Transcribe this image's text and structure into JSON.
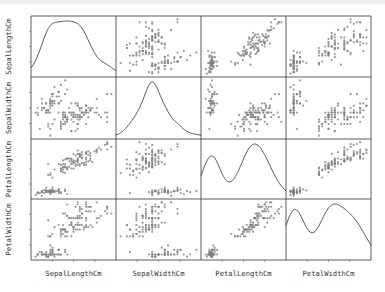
{
  "chart_data": {
    "type": "scatter_matrix",
    "title": "",
    "variables": [
      "SepalLengthCm",
      "SepalWidthCm",
      "PetalLengthCm",
      "PetalWidthCm"
    ],
    "diagonal": "kde",
    "grid": false,
    "legend": null,
    "ranges": {
      "SepalLengthCm": [
        4.3,
        7.9
      ],
      "SepalWidthCm": [
        2.0,
        4.4
      ],
      "PetalLengthCm": [
        1.0,
        6.9
      ],
      "PetalWidthCm": [
        0.1,
        2.5
      ]
    },
    "marker_color": "#808080",
    "line_color": "#444444",
    "frame_color": "#333333",
    "n_points": 150,
    "data": {
      "SepalLengthCm": [
        5.1,
        4.9,
        4.7,
        4.6,
        5.0,
        5.4,
        4.6,
        5.0,
        4.4,
        4.9,
        5.4,
        4.8,
        4.8,
        4.3,
        5.8,
        5.7,
        5.4,
        5.1,
        5.7,
        5.1,
        5.4,
        5.1,
        4.6,
        5.1,
        4.8,
        5.0,
        5.0,
        5.2,
        5.2,
        4.7,
        4.8,
        5.4,
        5.2,
        5.5,
        4.9,
        5.0,
        5.5,
        4.9,
        4.4,
        5.1,
        5.0,
        4.5,
        4.4,
        5.0,
        5.1,
        4.8,
        5.1,
        4.6,
        5.3,
        5.0,
        7.0,
        6.4,
        6.9,
        5.5,
        6.5,
        5.7,
        6.3,
        4.9,
        6.6,
        5.2,
        5.0,
        5.9,
        6.0,
        6.1,
        5.6,
        6.7,
        5.6,
        5.8,
        6.2,
        5.6,
        5.9,
        6.1,
        6.3,
        6.1,
        6.4,
        6.6,
        6.8,
        6.7,
        6.0,
        5.7,
        5.5,
        5.5,
        5.8,
        6.0,
        5.4,
        6.0,
        6.7,
        6.3,
        5.6,
        5.5,
        5.5,
        6.1,
        5.8,
        5.0,
        5.6,
        5.7,
        5.7,
        6.2,
        5.1,
        5.7,
        6.3,
        5.8,
        7.1,
        6.3,
        6.5,
        7.6,
        4.9,
        7.3,
        6.7,
        7.2,
        6.5,
        6.4,
        6.8,
        5.7,
        5.8,
        6.4,
        6.5,
        7.7,
        7.7,
        6.0,
        6.9,
        5.6,
        7.7,
        6.3,
        6.7,
        7.2,
        6.2,
        6.1,
        6.4,
        7.2,
        7.4,
        7.9,
        6.4,
        6.3,
        6.1,
        7.7,
        6.3,
        6.4,
        6.0,
        6.9,
        6.7,
        6.9,
        5.8,
        6.8,
        6.7,
        6.7,
        6.3,
        6.5,
        6.2,
        5.9
      ],
      "SepalWidthCm": [
        3.5,
        3.0,
        3.2,
        3.1,
        3.6,
        3.9,
        3.4,
        3.4,
        2.9,
        3.1,
        3.7,
        3.4,
        3.0,
        3.0,
        4.0,
        4.4,
        3.9,
        3.5,
        3.8,
        3.8,
        3.4,
        3.7,
        3.6,
        3.3,
        3.4,
        3.0,
        3.4,
        3.5,
        3.4,
        3.2,
        3.1,
        3.4,
        4.1,
        4.2,
        3.1,
        3.2,
        3.5,
        3.1,
        3.0,
        3.4,
        3.5,
        2.3,
        3.2,
        3.5,
        3.8,
        3.0,
        3.8,
        3.2,
        3.7,
        3.3,
        3.2,
        3.2,
        3.1,
        2.3,
        2.8,
        2.8,
        3.3,
        2.4,
        2.9,
        2.7,
        2.0,
        3.0,
        2.2,
        2.9,
        2.9,
        3.1,
        3.0,
        2.7,
        2.2,
        2.5,
        3.2,
        2.8,
        2.5,
        2.8,
        2.9,
        3.0,
        2.8,
        3.0,
        2.9,
        2.6,
        2.4,
        2.4,
        2.7,
        2.7,
        3.0,
        3.4,
        3.1,
        2.3,
        3.0,
        2.5,
        2.6,
        3.0,
        2.6,
        2.3,
        2.7,
        3.0,
        2.9,
        2.9,
        2.5,
        2.8,
        3.3,
        2.7,
        3.0,
        2.9,
        3.0,
        3.0,
        2.5,
        2.9,
        2.5,
        3.6,
        3.2,
        2.7,
        3.0,
        2.5,
        2.8,
        3.2,
        3.0,
        3.8,
        2.6,
        2.2,
        3.2,
        2.8,
        2.8,
        2.7,
        3.3,
        3.2,
        2.8,
        3.0,
        2.8,
        3.0,
        2.8,
        3.8,
        2.8,
        2.8,
        2.6,
        3.0,
        3.4,
        3.1,
        3.0,
        3.1,
        3.1,
        3.1,
        2.7,
        3.2,
        3.3,
        3.0,
        2.5,
        3.0,
        3.4,
        3.0
      ],
      "PetalLengthCm": [
        1.4,
        1.4,
        1.3,
        1.5,
        1.4,
        1.7,
        1.4,
        1.5,
        1.4,
        1.5,
        1.5,
        1.6,
        1.4,
        1.1,
        1.2,
        1.5,
        1.3,
        1.4,
        1.7,
        1.5,
        1.7,
        1.5,
        1.0,
        1.7,
        1.9,
        1.6,
        1.6,
        1.5,
        1.4,
        1.6,
        1.6,
        1.5,
        1.5,
        1.4,
        1.5,
        1.2,
        1.3,
        1.5,
        1.3,
        1.5,
        1.3,
        1.3,
        1.3,
        1.6,
        1.9,
        1.4,
        1.6,
        1.4,
        1.5,
        1.4,
        4.7,
        4.5,
        4.9,
        4.0,
        4.6,
        4.5,
        4.7,
        3.3,
        4.6,
        3.9,
        3.5,
        4.2,
        4.0,
        4.7,
        3.6,
        4.4,
        4.5,
        4.1,
        4.5,
        3.9,
        4.8,
        4.0,
        4.9,
        4.7,
        4.3,
        4.4,
        4.8,
        5.0,
        4.5,
        3.5,
        3.8,
        3.7,
        3.9,
        5.1,
        4.5,
        4.5,
        4.7,
        4.4,
        4.1,
        4.0,
        4.4,
        4.6,
        4.0,
        3.3,
        4.2,
        4.2,
        4.2,
        4.3,
        3.0,
        4.1,
        6.0,
        5.1,
        5.9,
        5.6,
        5.8,
        6.6,
        4.5,
        6.3,
        5.8,
        6.1,
        5.1,
        5.3,
        5.5,
        5.0,
        5.1,
        5.3,
        5.5,
        6.7,
        6.9,
        5.0,
        5.7,
        4.9,
        6.7,
        4.9,
        5.7,
        6.0,
        4.8,
        4.9,
        5.6,
        5.8,
        6.1,
        6.4,
        5.6,
        5.1,
        5.6,
        6.1,
        5.6,
        5.5,
        4.8,
        5.4,
        5.6,
        5.1,
        5.1,
        5.9,
        5.7,
        5.2,
        5.0,
        5.2,
        5.4,
        5.1
      ],
      "PetalWidthCm": [
        0.2,
        0.2,
        0.2,
        0.2,
        0.2,
        0.4,
        0.3,
        0.2,
        0.2,
        0.1,
        0.2,
        0.2,
        0.1,
        0.1,
        0.2,
        0.4,
        0.4,
        0.3,
        0.3,
        0.3,
        0.2,
        0.4,
        0.2,
        0.5,
        0.2,
        0.2,
        0.4,
        0.2,
        0.2,
        0.2,
        0.2,
        0.4,
        0.1,
        0.2,
        0.1,
        0.2,
        0.2,
        0.1,
        0.2,
        0.2,
        0.3,
        0.3,
        0.2,
        0.6,
        0.4,
        0.3,
        0.2,
        0.2,
        0.2,
        0.2,
        1.4,
        1.5,
        1.5,
        1.3,
        1.5,
        1.3,
        1.6,
        1.0,
        1.3,
        1.4,
        1.0,
        1.5,
        1.0,
        1.4,
        1.3,
        1.4,
        1.5,
        1.0,
        1.5,
        1.1,
        1.8,
        1.3,
        1.5,
        1.2,
        1.3,
        1.4,
        1.4,
        1.7,
        1.5,
        1.0,
        1.1,
        1.0,
        1.2,
        1.6,
        1.5,
        1.6,
        1.5,
        1.3,
        1.3,
        1.3,
        1.2,
        1.4,
        1.2,
        1.0,
        1.3,
        1.2,
        1.3,
        1.3,
        1.1,
        1.3,
        2.5,
        1.9,
        2.1,
        1.8,
        2.2,
        2.1,
        1.7,
        1.8,
        1.8,
        2.5,
        2.0,
        1.9,
        2.1,
        2.0,
        2.4,
        2.3,
        1.8,
        2.2,
        2.3,
        1.5,
        2.3,
        2.0,
        2.0,
        1.8,
        2.1,
        1.8,
        1.8,
        1.8,
        2.1,
        1.6,
        1.9,
        2.0,
        2.2,
        1.5,
        1.4,
        2.3,
        2.4,
        1.8,
        1.8,
        2.1,
        2.4,
        2.3,
        1.9,
        2.3,
        2.5,
        2.3,
        1.9,
        2.0,
        2.3,
        1.8
      ]
    },
    "xlabels": [
      "SepalLengthCm",
      "SepalWidthCm",
      "PetalLengthCm",
      "PetalWidthCm"
    ],
    "ylabels": [
      "SepalLengthCm",
      "SepalWidthCm",
      "PetalLengthCm",
      "PetalWidthCm"
    ]
  },
  "layout": {
    "col_edges": [
      31,
      116,
      201,
      286,
      371
    ],
    "row_edges": [
      16,
      77,
      139,
      199,
      260
    ]
  }
}
